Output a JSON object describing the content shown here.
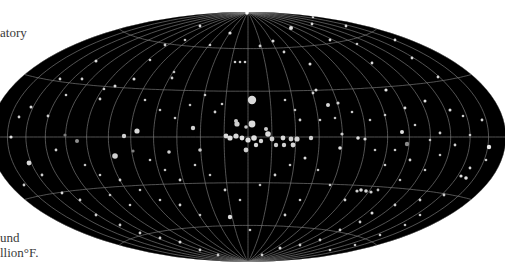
{
  "captions": {
    "top_fragment": "atory",
    "bottom_line1": "und",
    "bottom_line2": "llion°F."
  },
  "map": {
    "projection": "hammer-aitoff all-sky",
    "center_x": 248,
    "center_y": 137,
    "radius_x": 258,
    "radius_y": 125,
    "background_color": "#000000",
    "grid_color": "#8a8a8a",
    "star_color": "#e8e8e8",
    "meridian_step_deg": 15,
    "parallel_step_deg": 30
  },
  "stars": [
    [
      252,
      100,
      4.2,
      "#d9d9d9"
    ],
    [
      252,
      124,
      3.4,
      "#dcdcdc"
    ],
    [
      237,
      124,
      2.6,
      "#d0d0d0"
    ],
    [
      226,
      136,
      2.4,
      "#dadada"
    ],
    [
      230,
      138,
      2.6,
      "#e0e0e0"
    ],
    [
      236,
      136,
      2.6,
      "#d8d8d8"
    ],
    [
      242,
      138,
      2.4,
      "#e2e2e2"
    ],
    [
      248,
      140,
      2.6,
      "#dedede"
    ],
    [
      254,
      138,
      2.8,
      "#e0e0e0"
    ],
    [
      261,
      141,
      2.2,
      "#d6d6d6"
    ],
    [
      268,
      134,
      2.8,
      "#dcdcdc"
    ],
    [
      272,
      139,
      2.4,
      "#d2d2d2"
    ],
    [
      283,
      138,
      2.4,
      "#d8d8d8"
    ],
    [
      291,
      139,
      2.4,
      "#d0d0d0"
    ],
    [
      297,
      139,
      2.6,
      "#d6d6d6"
    ],
    [
      311,
      138,
      2.2,
      "#d0d0d0"
    ],
    [
      246,
      150,
      2.4,
      "#cfcfcf"
    ],
    [
      256,
      145,
      2.2,
      "#d6d6d6"
    ],
    [
      276,
      145,
      2.2,
      "#cccccc"
    ],
    [
      284,
      145,
      2.2,
      "#d0d0d0"
    ],
    [
      293,
      145,
      2.4,
      "#d6d6d6"
    ],
    [
      266,
      129,
      2.0,
      "#cccccc"
    ],
    [
      193,
      128,
      2.2,
      "#d0d0d0"
    ],
    [
      236,
      121,
      2.0,
      "#cccccc"
    ],
    [
      246,
      127,
      1.8,
      "#c8c8c8"
    ],
    [
      137,
      131,
      2.6,
      "#d8d8d8"
    ],
    [
      124,
      136,
      2.2,
      "#cfcfcf"
    ],
    [
      115,
      156,
      2.8,
      "#cfcfcf"
    ],
    [
      29,
      163,
      2.4,
      "#d8d8d8"
    ],
    [
      77,
      141,
      2.0,
      "#8f8f8f"
    ],
    [
      133,
      151,
      1.6,
      "#7f7f7f"
    ],
    [
      65,
      135,
      1.6,
      "#7a7a7a"
    ],
    [
      169,
      152,
      1.8,
      "#d0d0d0"
    ],
    [
      200,
      150,
      1.8,
      "#cccccc"
    ],
    [
      11,
      137,
      1.6,
      "#e0e0e0"
    ],
    [
      402,
      132,
      2.0,
      "#dedede"
    ],
    [
      407,
      144,
      2.2,
      "#8a8a8a"
    ],
    [
      489,
      147,
      2.2,
      "#e8e8e8"
    ],
    [
      340,
      148,
      1.8,
      "#dedede"
    ],
    [
      328,
      105,
      2.0,
      "#d8d8d8"
    ],
    [
      338,
      103,
      1.6,
      "#d0d0d0"
    ],
    [
      358,
      138,
      1.8,
      "#e0e0e0"
    ],
    [
      365,
      139,
      1.6,
      "#d8d8d8"
    ],
    [
      342,
      134,
      1.6,
      "#cccccc"
    ],
    [
      230,
      217,
      2.2,
      "#dcdcdc"
    ],
    [
      361,
      190,
      1.8,
      "#d8d8d8"
    ],
    [
      366,
      191,
      1.8,
      "#d8d8d8"
    ],
    [
      357,
      191,
      1.6,
      "#d0d0d0"
    ],
    [
      371,
      192,
      1.6,
      "#d0d0d0"
    ],
    [
      378,
      190,
      1.4,
      "#bdbdbd"
    ],
    [
      466,
      178,
      1.8,
      "#e0e0e0"
    ],
    [
      461,
      176,
      1.6,
      "#dcdcdc"
    ],
    [
      247,
      13,
      1.8,
      "#ffffff"
    ],
    [
      291,
      28,
      2.0,
      "#e0e0e0"
    ],
    [
      230,
      33,
      1.6,
      "#e0e0e0"
    ],
    [
      312,
      24,
      1.4,
      "#dcdcdc"
    ],
    [
      200,
      26,
      1.4,
      "#dcdcdc"
    ],
    [
      235,
      62,
      1.3,
      "#cccccc"
    ],
    [
      240,
      62,
      1.3,
      "#cccccc"
    ],
    [
      245,
      62,
      1.3,
      "#cccccc"
    ],
    [
      310,
      64,
      1.5,
      "#dcdcdc"
    ],
    [
      316,
      90,
      1.5,
      "#dcdcdc"
    ],
    [
      313,
      93,
      1.4,
      "#cccccc"
    ],
    [
      172,
      78,
      1.4,
      "#cccccc"
    ],
    [
      174,
      72,
      1.3,
      "#bdbdbd"
    ],
    [
      134,
      79,
      1.5,
      "#dcdcdc"
    ],
    [
      115,
      86,
      1.5,
      "#d8d8d8"
    ],
    [
      100,
      99,
      1.4,
      "#d0d0d0"
    ],
    [
      104,
      89,
      1.3,
      "#c8c8c8"
    ],
    [
      60,
      79,
      1.4,
      "#d0d0d0"
    ],
    [
      31,
      107,
      1.5,
      "#dcdcdc"
    ],
    [
      19,
      117,
      1.4,
      "#d0d0d0"
    ],
    [
      405,
      108,
      1.4,
      "#dcdcdc"
    ],
    [
      425,
      101,
      1.5,
      "#e0e0e0"
    ],
    [
      450,
      110,
      1.5,
      "#dcdcdc"
    ],
    [
      463,
      116,
      1.3,
      "#d0d0d0"
    ],
    [
      440,
      133,
      1.4,
      "#cccccc"
    ],
    [
      482,
      120,
      1.4,
      "#d8d8d8"
    ],
    [
      386,
      90,
      1.6,
      "#e6e6e6"
    ],
    [
      372,
      63,
      1.4,
      "#dcdcdc"
    ],
    [
      346,
      26,
      1.4,
      "#dcdcdc"
    ],
    [
      395,
      40,
      1.4,
      "#dcdcdc"
    ],
    [
      412,
      58,
      1.4,
      "#d8d8d8"
    ],
    [
      438,
      77,
      1.4,
      "#d8d8d8"
    ],
    [
      357,
      44,
      1.3,
      "#c8c8c8"
    ],
    [
      273,
      41,
      1.5,
      "#dcdcdc"
    ],
    [
      284,
      52,
      1.4,
      "#d0d0d0"
    ],
    [
      260,
      46,
      1.4,
      "#d0d0d0"
    ],
    [
      313,
      17,
      1.3,
      "#d0d0d0"
    ],
    [
      330,
      40,
      1.4,
      "#d8d8d8"
    ],
    [
      96,
      61,
      1.5,
      "#dcdcdc"
    ],
    [
      82,
      79,
      1.4,
      "#d0d0d0"
    ],
    [
      66,
      95,
      1.3,
      "#cccccc"
    ],
    [
      48,
      116,
      1.4,
      "#cccccc"
    ],
    [
      56,
      150,
      1.4,
      "#d0d0d0"
    ],
    [
      42,
      175,
      1.4,
      "#cccccc"
    ],
    [
      24,
      185,
      1.4,
      "#d0d0d0"
    ],
    [
      62,
      193,
      1.4,
      "#d8d8d8"
    ],
    [
      80,
      200,
      1.4,
      "#d0d0d0"
    ],
    [
      96,
      215,
      1.4,
      "#d0d0d0"
    ],
    [
      120,
      225,
      1.4,
      "#cccccc"
    ],
    [
      140,
      233,
      1.4,
      "#d0d0d0"
    ],
    [
      160,
      238,
      1.4,
      "#d0d0d0"
    ],
    [
      180,
      242,
      1.5,
      "#dcdcdc"
    ],
    [
      200,
      250,
      1.4,
      "#d0d0d0"
    ],
    [
      218,
      255,
      1.4,
      "#cccccc"
    ],
    [
      262,
      255,
      1.4,
      "#d0d0d0"
    ],
    [
      280,
      248,
      1.5,
      "#dcdcdc"
    ],
    [
      300,
      245,
      1.4,
      "#d0d0d0"
    ],
    [
      320,
      240,
      1.4,
      "#cccccc"
    ],
    [
      340,
      230,
      1.4,
      "#d0d0d0"
    ],
    [
      360,
      222,
      1.4,
      "#cccccc"
    ],
    [
      372,
      213,
      1.5,
      "#dcdcdc"
    ],
    [
      395,
      205,
      1.4,
      "#cccccc"
    ],
    [
      420,
      200,
      1.4,
      "#d0d0d0"
    ],
    [
      444,
      195,
      1.4,
      "#cccccc"
    ],
    [
      470,
      168,
      1.4,
      "#d0d0d0"
    ],
    [
      486,
      160,
      1.3,
      "#cccccc"
    ],
    [
      150,
      60,
      1.3,
      "#cccccc"
    ],
    [
      165,
      45,
      1.4,
      "#d0d0d0"
    ],
    [
      185,
      40,
      1.3,
      "#c8c8c8"
    ],
    [
      210,
      45,
      1.3,
      "#cccccc"
    ],
    [
      145,
      100,
      1.3,
      "#c8c8c8"
    ],
    [
      160,
      110,
      1.3,
      "#c0c0c0"
    ],
    [
      175,
      118,
      1.3,
      "#c8c8c8"
    ],
    [
      190,
      105,
      1.3,
      "#c0c0c0"
    ],
    [
      205,
      95,
      1.3,
      "#c8c8c8"
    ],
    [
      215,
      112,
      1.4,
      "#d0d0d0"
    ],
    [
      222,
      104,
      1.3,
      "#c8c8c8"
    ],
    [
      285,
      100,
      1.3,
      "#c8c8c8"
    ],
    [
      295,
      110,
      1.3,
      "#c0c0c0"
    ],
    [
      300,
      120,
      1.4,
      "#d0d0d0"
    ],
    [
      320,
      120,
      1.3,
      "#c8c8c8"
    ],
    [
      335,
      118,
      1.3,
      "#c0c0c0"
    ],
    [
      352,
      112,
      1.3,
      "#c8c8c8"
    ],
    [
      370,
      120,
      1.3,
      "#c0c0c0"
    ],
    [
      385,
      115,
      1.3,
      "#c8c8c8"
    ],
    [
      150,
      160,
      1.3,
      "#c8c8c8"
    ],
    [
      165,
      170,
      1.3,
      "#c0c0c0"
    ],
    [
      180,
      180,
      1.4,
      "#d0d0d0"
    ],
    [
      195,
      165,
      1.3,
      "#c8c8c8"
    ],
    [
      210,
      175,
      1.3,
      "#c0c0c0"
    ],
    [
      225,
      190,
      1.4,
      "#d0d0d0"
    ],
    [
      240,
      200,
      1.3,
      "#c8c8c8"
    ],
    [
      260,
      185,
      1.3,
      "#c0c0c0"
    ],
    [
      275,
      175,
      1.4,
      "#d0d0d0"
    ],
    [
      290,
      165,
      1.3,
      "#c8c8c8"
    ],
    [
      305,
      158,
      1.5,
      "#dcdcdc"
    ],
    [
      318,
      170,
      1.3,
      "#c0c0c0"
    ],
    [
      330,
      185,
      1.3,
      "#c8c8c8"
    ],
    [
      345,
      200,
      1.4,
      "#d0d0d0"
    ],
    [
      300,
      200,
      1.3,
      "#c8c8c8"
    ],
    [
      285,
      215,
      1.4,
      "#d0d0d0"
    ],
    [
      250,
      230,
      1.3,
      "#c8c8c8"
    ],
    [
      200,
      215,
      1.3,
      "#c0c0c0"
    ],
    [
      180,
      205,
      1.4,
      "#d0d0d0"
    ],
    [
      160,
      200,
      1.3,
      "#c8c8c8"
    ],
    [
      140,
      190,
      1.3,
      "#c0c0c0"
    ],
    [
      120,
      180,
      1.4,
      "#d0d0d0"
    ],
    [
      100,
      175,
      1.3,
      "#c8c8c8"
    ],
    [
      85,
      165,
      1.3,
      "#c0c0c0"
    ],
    [
      130,
      205,
      1.3,
      "#c8c8c8"
    ],
    [
      110,
      195,
      1.3,
      "#c0c0c0"
    ],
    [
      395,
      150,
      1.3,
      "#c8c8c8"
    ],
    [
      410,
      160,
      1.4,
      "#d0d0d0"
    ],
    [
      425,
      170,
      1.3,
      "#c8c8c8"
    ],
    [
      440,
      155,
      1.3,
      "#c0c0c0"
    ],
    [
      455,
      145,
      1.4,
      "#d0d0d0"
    ],
    [
      470,
      135,
      1.3,
      "#c8c8c8"
    ],
    [
      430,
      140,
      1.3,
      "#c0c0c0"
    ],
    [
      415,
      125,
      1.3,
      "#c8c8c8"
    ],
    [
      400,
      180,
      1.3,
      "#c0c0c0"
    ],
    [
      385,
      165,
      1.3,
      "#c8c8c8"
    ],
    [
      375,
      150,
      1.3,
      "#c0c0c0"
    ],
    [
      420,
      215,
      1.3,
      "#c8c8c8"
    ],
    [
      405,
      225,
      1.3,
      "#c0c0c0"
    ],
    [
      380,
      235,
      1.3,
      "#c8c8c8"
    ],
    [
      355,
      245,
      1.3,
      "#c0c0c0"
    ],
    [
      330,
      250,
      1.3,
      "#c8c8c8"
    ]
  ]
}
